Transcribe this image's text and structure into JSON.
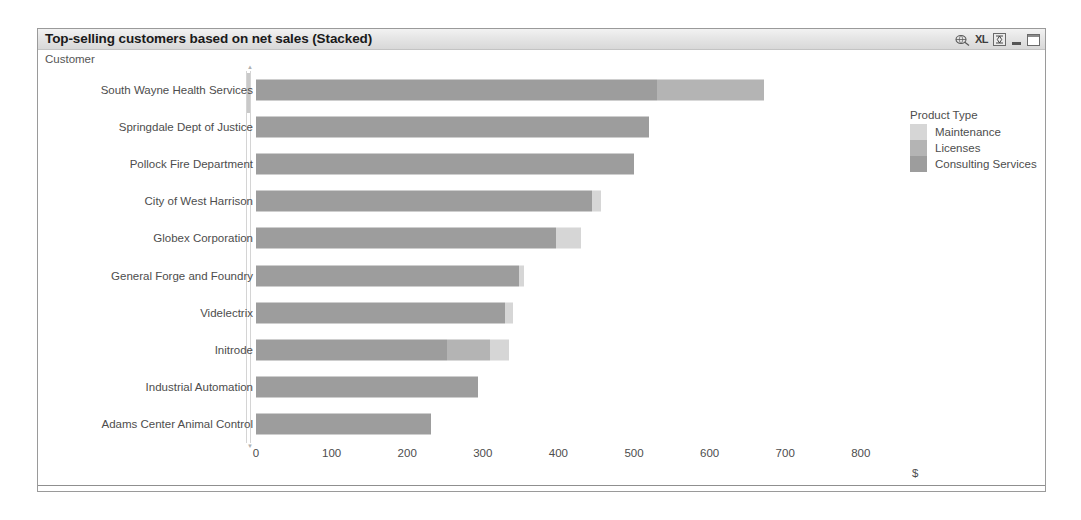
{
  "window": {
    "title": "Top-selling customers based on net sales (Stacked)",
    "controls": [
      {
        "name": "print-icon",
        "glyph": "⎙"
      },
      {
        "name": "excel-export-label",
        "glyph": "XL"
      },
      {
        "name": "restore-icon",
        "glyph": "❐"
      },
      {
        "name": "minimize-icon",
        "glyph": ""
      },
      {
        "name": "maximize-icon",
        "glyph": ""
      }
    ]
  },
  "legend": {
    "title": "Product Type",
    "items": [
      {
        "label": "Maintenance",
        "color": "#d6d6d6"
      },
      {
        "label": "Licenses",
        "color": "#b4b4b4"
      },
      {
        "label": "Consulting Services",
        "color": "#9d9d9d"
      }
    ]
  },
  "chart_data": {
    "type": "bar",
    "orientation": "horizontal",
    "stacked": true,
    "title": "Top-selling customers based on net sales (Stacked)",
    "xlabel": "$",
    "ylabel": "Customer",
    "xlim": [
      0,
      850
    ],
    "xticks": [
      0,
      100,
      200,
      300,
      400,
      500,
      600,
      700,
      800
    ],
    "grid": false,
    "legend_position": "right",
    "categories": [
      "South Wayne Health Services",
      "Springdale Dept of Justice",
      "Pollock Fire Department",
      "City of West Harrison",
      "Globex Corporation",
      "General Forge and Foundry",
      "Videlectrix",
      "Initrode",
      "Industrial Automation",
      "Adams Center Animal Control"
    ],
    "series": [
      {
        "name": "Consulting Services",
        "color": "#9d9d9d",
        "values": [
          530,
          520,
          500,
          445,
          397,
          348,
          330,
          253,
          294,
          231
        ]
      },
      {
        "name": "Licenses",
        "color": "#b4b4b4",
        "values": [
          142,
          0,
          0,
          0,
          0,
          0,
          0,
          57,
          0,
          0
        ]
      },
      {
        "name": "Maintenance",
        "color": "#d6d6d6",
        "values": [
          0,
          0,
          0,
          11,
          33,
          6,
          10,
          25,
          0,
          0
        ]
      }
    ],
    "totals": [
      672,
      520,
      500,
      456,
      430,
      354,
      340,
      335,
      294,
      231
    ]
  }
}
